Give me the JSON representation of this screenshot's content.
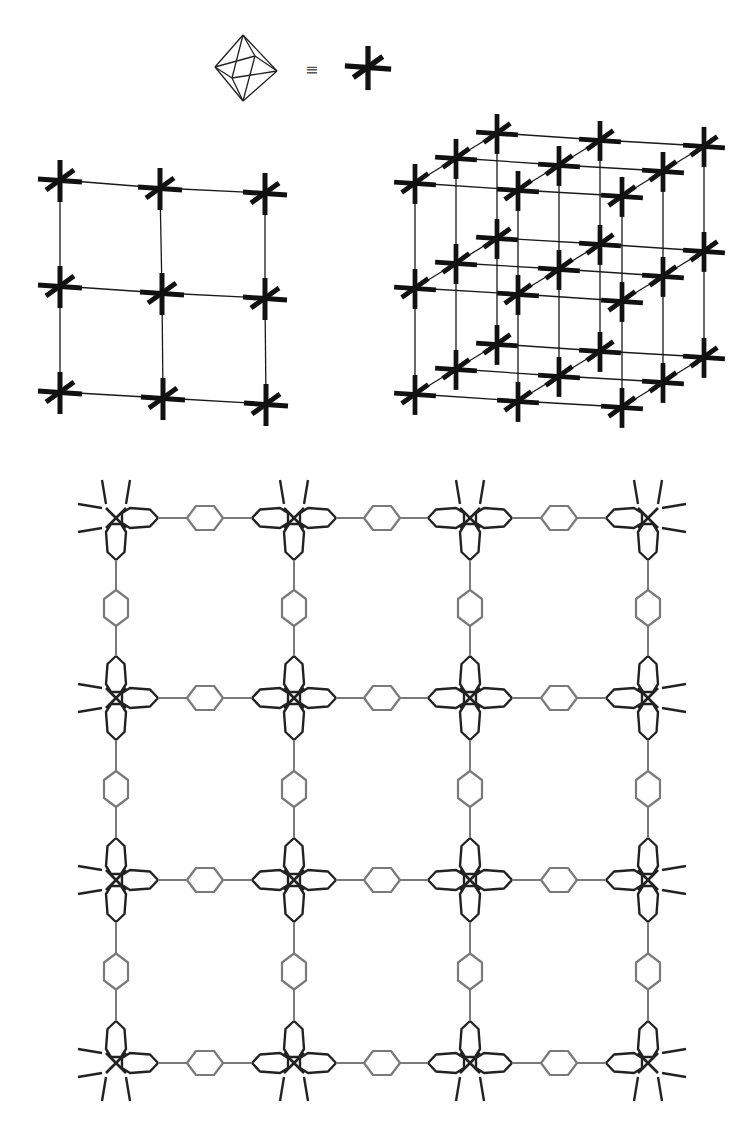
{
  "legend": {
    "equivalence_symbol": "≡",
    "left_icon": "octahedron-icon",
    "right_icon": "six-connected-node-icon",
    "octahedron_center": [
      245,
      68
    ],
    "node_icon_center": [
      368,
      67
    ],
    "equiv_position": [
      305,
      60
    ]
  },
  "colors": {
    "node_stroke": "#111111",
    "edge_stroke": "#1a1a1a",
    "molecule_dark": "#222222",
    "molecule_light": "#7a7a7a",
    "background": "#ffffff"
  },
  "grid_2d": {
    "label": "2D square grid of 6-connected nodes",
    "rows": [
      [
        [
          60,
          180
        ],
        [
          160,
          188
        ],
        [
          265,
          193
        ]
      ],
      [
        [
          60,
          286
        ],
        [
          162,
          293
        ],
        [
          265,
          298
        ]
      ],
      [
        [
          60,
          392
        ],
        [
          163,
          398
        ],
        [
          266,
          404
        ]
      ]
    ]
  },
  "cube_3d": {
    "label": "3D primitive cubic net",
    "front_plane": [
      [
        [
          415,
          183
        ],
        [
          518,
          190
        ],
        [
          622,
          196
        ]
      ],
      [
        [
          415,
          288
        ],
        [
          518,
          294
        ],
        [
          622,
          301
        ]
      ],
      [
        [
          415,
          394
        ],
        [
          518,
          401
        ],
        [
          622,
          407
        ]
      ]
    ],
    "depth_offset": [
      41,
      -25
    ],
    "layers": 3
  },
  "framework": {
    "label": "Crystal structure: metal nodes linked by benzene dicarboxylate-type linkers",
    "columns_x": [
      116,
      294,
      470,
      648
    ],
    "rows_y": [
      518,
      698,
      880,
      1063
    ],
    "lobe_length": 42,
    "lobe_width": 20,
    "stub_length": 24,
    "ring_length": 36,
    "ring_width": 24
  }
}
